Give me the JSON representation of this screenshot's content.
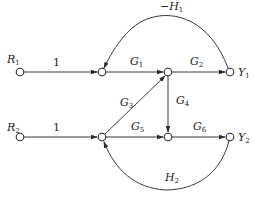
{
  "diagram": {
    "type": "signal-flow-graph",
    "nodes": {
      "R1": {
        "main": "R",
        "sub": "1",
        "x": 20,
        "y": 72
      },
      "N1": {
        "x": 102,
        "y": 72
      },
      "N2": {
        "x": 168,
        "y": 72
      },
      "Y1": {
        "main": "Y",
        "sub": "1",
        "x": 230,
        "y": 72
      },
      "R2": {
        "main": "R",
        "sub": "2",
        "x": 20,
        "y": 137
      },
      "N3": {
        "x": 102,
        "y": 137
      },
      "N4": {
        "x": 168,
        "y": 137
      },
      "Y2": {
        "main": "Y",
        "sub": "2",
        "x": 230,
        "y": 137
      }
    },
    "edges": {
      "r1_n1": {
        "label": "1"
      },
      "n1_n2": {
        "main": "G",
        "sub": "1"
      },
      "n2_y1": {
        "main": "G",
        "sub": "2"
      },
      "y1_n1": {
        "prefix": "−",
        "main": "H",
        "sub": "1"
      },
      "n3_n2": {
        "main": "G",
        "sub": "3"
      },
      "n2_n4": {
        "main": "G",
        "sub": "4"
      },
      "r2_n3": {
        "label": "1"
      },
      "n3_n4": {
        "main": "G",
        "sub": "5"
      },
      "n4_y2": {
        "main": "G",
        "sub": "6"
      },
      "y2_n3": {
        "main": "H",
        "sub": "2"
      }
    }
  }
}
